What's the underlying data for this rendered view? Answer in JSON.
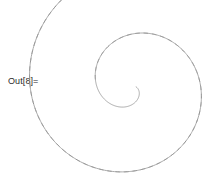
{
  "cell": {
    "label": "Out[8]="
  },
  "chart_data": {
    "type": "line",
    "title": "",
    "subtitle": "",
    "xlabel": "",
    "ylabel": "",
    "grid": false,
    "axes_visible": false,
    "legend": null,
    "annotations": [],
    "background": "#ffffff",
    "plot_description": "Two interleaved Archimedean spirals sharing a common center; one rendered with a solid thin gray stroke, the other with a dashed gray stroke of the same weight. Each winds outward for roughly two and a half turns.",
    "center": {
      "x": 132,
      "y": 86
    },
    "xlim": [
      0,
      223
    ],
    "ylim": [
      0,
      174
    ],
    "series": [
      {
        "name": "solid-spiral",
        "style": "solid",
        "color": "#8d8d8d",
        "stroke_width": 0.75,
        "dash_pattern": null,
        "spiral_type": "archimedean",
        "a": 2.0,
        "b": 10.6,
        "theta_start_deg": 10,
        "theta_end_deg": 980,
        "turns": 2.69,
        "r_start": 2.0,
        "r_end": 183.5
      },
      {
        "name": "dashed-spiral",
        "style": "dashed",
        "color": "#8d8d8d",
        "stroke_width": 0.75,
        "dash_pattern": [
          4.6,
          3.8
        ],
        "spiral_type": "archimedean",
        "a": 2.0,
        "b": 10.6,
        "theta_start_deg": 190,
        "theta_end_deg": 1160,
        "turns": 2.69,
        "r_start": 37.1,
        "r_end": 216.7
      }
    ]
  }
}
